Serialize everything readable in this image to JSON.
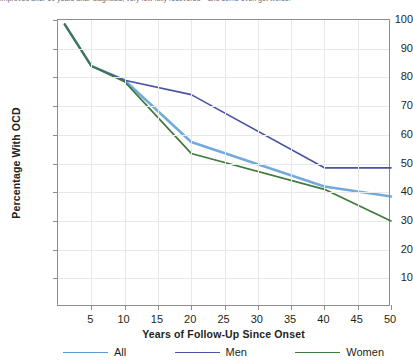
{
  "caption": {
    "text": "improved after 10 years after diagnosis, very few fully recovered—and some even got worse."
  },
  "chart_data": {
    "type": "line",
    "title": "",
    "xlabel": "Years of Follow-Up Since Onset",
    "ylabel": "Percentage With OCD",
    "xlim": [
      0,
      50
    ],
    "ylim": [
      0,
      100
    ],
    "xticks": [
      5,
      10,
      15,
      20,
      25,
      30,
      35,
      40,
      45,
      50
    ],
    "yticks": [
      10,
      20,
      30,
      40,
      50,
      60,
      70,
      80,
      90,
      100
    ],
    "grid": true,
    "legend_position": "bottom",
    "x": [
      1,
      5,
      10,
      20,
      40,
      50
    ],
    "series": [
      {
        "name": "All",
        "color": "#5B9BD5",
        "values": [
          98.5,
          84.0,
          79.0,
          57.5,
          42.0,
          38.5
        ]
      },
      {
        "name": "Men",
        "color": "#4C52A4",
        "values": [
          98.5,
          84.0,
          79.0,
          74.0,
          48.5,
          48.5
        ]
      },
      {
        "name": "Women",
        "color": "#3E7A3C",
        "values": [
          98.5,
          84.0,
          78.5,
          53.5,
          41.0,
          30.0
        ]
      }
    ]
  },
  "legend": {
    "items": [
      {
        "label": "All",
        "color": "#5B9BD5"
      },
      {
        "label": "Men",
        "color": "#4C52A4"
      },
      {
        "label": "Women",
        "color": "#3E7A3C"
      }
    ]
  },
  "axis_colors": {
    "axis_line": "#8d8d8d",
    "gridline": "#e8e8e8",
    "text": "#231f20"
  }
}
